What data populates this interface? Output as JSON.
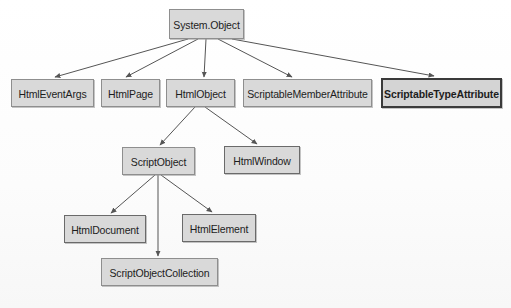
{
  "diagram": {
    "type": "class-hierarchy",
    "root": "System.Object",
    "nodes": [
      {
        "id": "system-object",
        "label": "System.Object",
        "x": 169,
        "y": 9,
        "w": 75,
        "h": 30,
        "weight": "normal",
        "level": 0
      },
      {
        "id": "html-event-args",
        "label": "HtmlEventArgs",
        "x": 11,
        "y": 79,
        "w": 83,
        "h": 28,
        "weight": "normal",
        "level": 1
      },
      {
        "id": "html-page",
        "label": "HtmlPage",
        "x": 101,
        "y": 79,
        "w": 59,
        "h": 28,
        "weight": "normal",
        "level": 1
      },
      {
        "id": "html-object",
        "label": "HtmlObject",
        "x": 166,
        "y": 79,
        "w": 69,
        "h": 28,
        "weight": "normal",
        "level": 1
      },
      {
        "id": "scriptable-member-attribute",
        "label": "ScriptableMemberAttribute",
        "x": 243,
        "y": 79,
        "w": 129,
        "h": 28,
        "weight": "normal",
        "level": 1
      },
      {
        "id": "scriptable-type-attribute",
        "label": "ScriptableTypeAttribute",
        "x": 381,
        "y": 78,
        "w": 121,
        "h": 30,
        "weight": "heavy",
        "level": 1
      },
      {
        "id": "script-object",
        "label": "ScriptObject",
        "x": 122,
        "y": 147,
        "w": 73,
        "h": 28,
        "weight": "normal",
        "level": 2
      },
      {
        "id": "html-window",
        "label": "HtmlWindow",
        "x": 224,
        "y": 146,
        "w": 76,
        "h": 28,
        "weight": "medium",
        "level": 2
      },
      {
        "id": "html-document",
        "label": "HtmlDocument",
        "x": 64,
        "y": 215,
        "w": 82,
        "h": 28,
        "weight": "medium",
        "level": 3
      },
      {
        "id": "html-element",
        "label": "HtmlElement",
        "x": 182,
        "y": 214,
        "w": 74,
        "h": 28,
        "weight": "medium",
        "level": 3
      },
      {
        "id": "script-object-collection",
        "label": "ScriptObjectCollection",
        "x": 101,
        "y": 258,
        "w": 117,
        "h": 28,
        "weight": "normal",
        "level": 4
      }
    ],
    "edges": [
      {
        "id": "edge-object-to-eventargs",
        "from": "system-object",
        "to": "html-event-args",
        "x1": 188,
        "y1": 39,
        "x2": 55,
        "y2": 77
      },
      {
        "id": "edge-object-to-page",
        "from": "system-object",
        "to": "html-page",
        "x1": 198,
        "y1": 39,
        "x2": 126,
        "y2": 77
      },
      {
        "id": "edge-object-to-htmlobject",
        "from": "system-object",
        "to": "html-object",
        "x1": 206,
        "y1": 39,
        "x2": 204,
        "y2": 77
      },
      {
        "id": "edge-object-to-memberattribute",
        "from": "system-object",
        "to": "scriptable-member-attribute",
        "x1": 218,
        "y1": 39,
        "x2": 292,
        "y2": 77
      },
      {
        "id": "edge-object-to-typeattribute",
        "from": "system-object",
        "to": "scriptable-type-attribute",
        "x1": 232,
        "y1": 39,
        "x2": 434,
        "y2": 76
      },
      {
        "id": "edge-htmlobject-to-scriptobject",
        "from": "html-object",
        "to": "script-object",
        "x1": 195,
        "y1": 107,
        "x2": 160,
        "y2": 145
      },
      {
        "id": "edge-htmlobject-to-htmlwindow",
        "from": "html-object",
        "to": "html-window",
        "x1": 205,
        "y1": 107,
        "x2": 257,
        "y2": 144
      },
      {
        "id": "edge-scriptobject-to-document",
        "from": "script-object",
        "to": "html-document",
        "x1": 155,
        "y1": 175,
        "x2": 111,
        "y2": 213
      },
      {
        "id": "edge-scriptobject-to-element",
        "from": "script-object",
        "to": "html-element",
        "x1": 161,
        "y1": 175,
        "x2": 212,
        "y2": 212
      },
      {
        "id": "edge-scriptobject-to-collection",
        "from": "script-object",
        "to": "script-object-collection",
        "x1": 158,
        "y1": 175,
        "x2": 158,
        "y2": 256
      }
    ],
    "colors": {
      "node_fill": "#d9d9d9",
      "node_border": "#8e8e8e",
      "node_border_medium": "#6a6a6a",
      "node_border_heavy": "#3a3a3a",
      "edge_stroke": "#555555",
      "text": "#1d1d1d",
      "background": "#fdfdfd"
    }
  }
}
